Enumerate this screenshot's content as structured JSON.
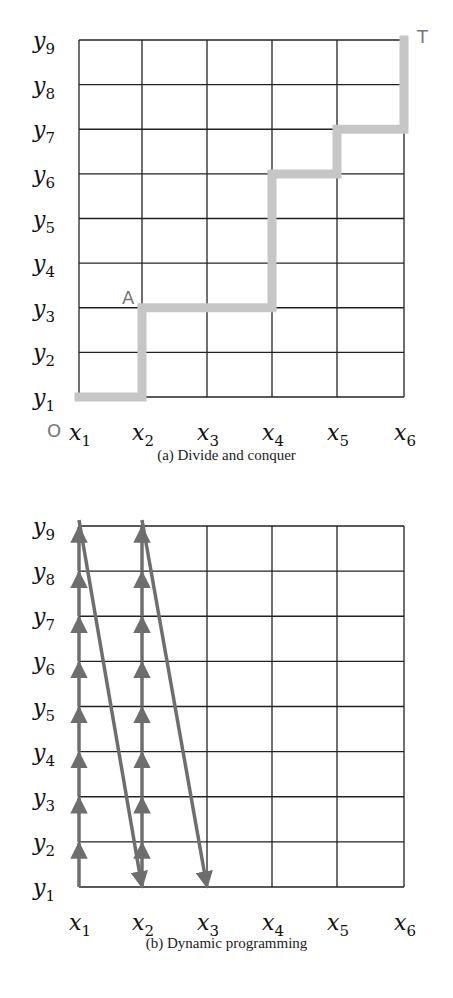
{
  "figure": {
    "panels": [
      {
        "id": "a",
        "caption": "(a) Divide and conquer",
        "x_labels": [
          "x1",
          "x2",
          "x3",
          "x4",
          "x5",
          "x6"
        ],
        "y_labels": [
          "y1",
          "y2",
          "y3",
          "y4",
          "y5",
          "y6",
          "y7",
          "y8",
          "y9"
        ],
        "point_labels": {
          "origin": "O",
          "midpoint": "A",
          "target": "T"
        },
        "path": [
          [
            1,
            1
          ],
          [
            2,
            1
          ],
          [
            2,
            3
          ],
          [
            4,
            3
          ],
          [
            4,
            6
          ],
          [
            5,
            6
          ],
          [
            5,
            7
          ],
          [
            6,
            7
          ],
          [
            6,
            9
          ]
        ],
        "path_color": "#c6c6c6"
      },
      {
        "id": "b",
        "caption": "(b) Dynamic programming",
        "x_labels": [
          "x1",
          "x2",
          "x3",
          "x4",
          "x5",
          "x6"
        ],
        "y_labels": [
          "y1",
          "y2",
          "y3",
          "y4",
          "y5",
          "y6",
          "y7",
          "y8",
          "y9"
        ],
        "arrows": [
          {
            "from": [
              1,
              1
            ],
            "to": [
              1,
              9
            ],
            "type": "vertical-steps"
          },
          {
            "from": [
              1,
              9
            ],
            "to": [
              2,
              1
            ],
            "type": "diagonal"
          },
          {
            "from": [
              2,
              1
            ],
            "to": [
              2,
              9
            ],
            "type": "vertical-steps"
          },
          {
            "from": [
              2,
              9
            ],
            "to": [
              3,
              1
            ],
            "type": "diagonal"
          }
        ],
        "arrow_color": "#6e6e6e"
      }
    ],
    "grid_color": "#222222"
  }
}
